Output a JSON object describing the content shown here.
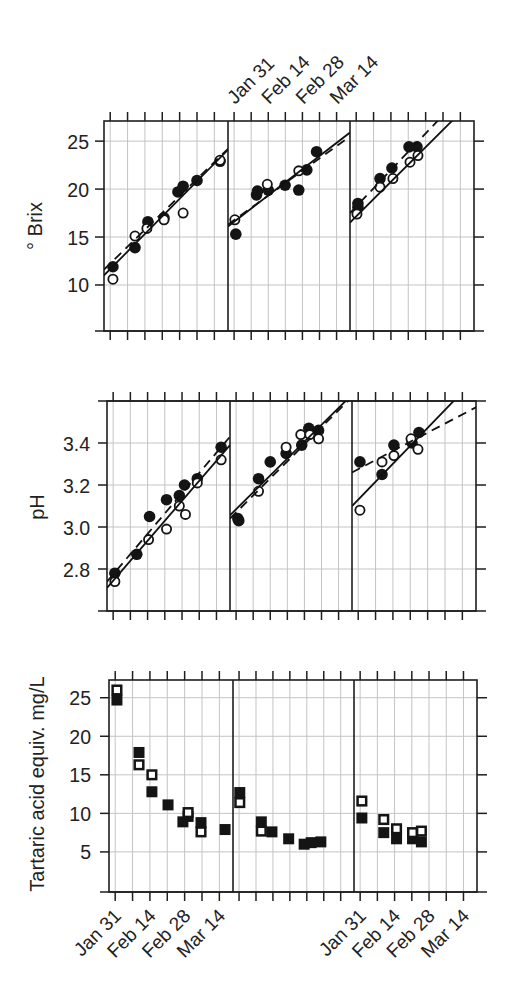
{
  "chart_data": [
    {
      "name": "brix",
      "type": "scatter",
      "title": "",
      "xlabel": "",
      "ylabel": "° Brix",
      "x_unit": "days from Jan 31",
      "xlim": [
        -2.5,
        47.5
      ],
      "xticks": [
        0,
        7,
        14,
        21,
        28,
        35,
        42
      ],
      "xtick_labels": [
        {
          "x": 0,
          "label": "Jan 31"
        },
        {
          "x": 14,
          "label": "Feb 14"
        },
        {
          "x": 28,
          "label": "Feb 28"
        },
        {
          "x": 42,
          "label": "Mar 14"
        }
      ],
      "ylim": [
        5.2,
        27.1
      ],
      "yticks": [
        10,
        15,
        20,
        25
      ],
      "ytick_labels": [
        "10",
        "15",
        "20",
        "25"
      ],
      "grid": true,
      "panels": [
        {
          "name": "panel-1",
          "series": [
            {
              "name": "filled",
              "marker": "filled-circle",
              "points": [
                [
                  1.1,
                  11.9
                ],
                [
                  10.0,
                  13.9
                ],
                [
                  15.2,
                  16.6
                ],
                [
                  21.7,
                  17.0
                ],
                [
                  27.3,
                  19.7
                ],
                [
                  29.4,
                  20.3
                ],
                [
                  35.0,
                  20.9
                ],
                [
                  44.3,
                  22.9
                ]
              ]
            },
            {
              "name": "open",
              "marker": "open-circle",
              "points": [
                [
                  1.1,
                  10.6
                ],
                [
                  10.0,
                  15.1
                ],
                [
                  14.8,
                  15.9
                ],
                [
                  21.7,
                  16.8
                ],
                [
                  29.4,
                  17.5
                ],
                [
                  44.3,
                  23.0
                ]
              ]
            }
          ],
          "fit_lines": [
            {
              "style": "solid",
              "x": [
                -2.5,
                47.5
              ],
              "y": [
                11.0,
                24.1
              ]
            },
            {
              "style": "dashed",
              "x": [
                -2.5,
                47.5
              ],
              "y": [
                11.6,
                24.2
              ]
            }
          ]
        },
        {
          "name": "panel-2",
          "series": [
            {
              "name": "filled",
              "marker": "filled-circle",
              "points": [
                [
                  0.7,
                  15.3
                ],
                [
                  9.2,
                  19.4
                ],
                [
                  9.6,
                  19.8
                ],
                [
                  14.0,
                  19.9
                ],
                [
                  20.9,
                  20.4
                ],
                [
                  26.5,
                  19.9
                ],
                [
                  29.8,
                  22.0
                ],
                [
                  33.8,
                  23.9
                ]
              ]
            },
            {
              "name": "open",
              "marker": "open-circle",
              "points": [
                [
                  0.3,
                  16.8
                ],
                [
                  13.6,
                  20.5
                ],
                [
                  26.5,
                  21.9
                ]
              ]
            }
          ],
          "fit_lines": [
            {
              "style": "solid",
              "x": [
                -2.5,
                47.5
              ],
              "y": [
                16.1,
                25.9
              ]
            },
            {
              "style": "dashed",
              "x": [
                -2.5,
                47.5
              ],
              "y": [
                16.3,
                25.5
              ]
            }
          ]
        },
        {
          "name": "panel-3",
          "series": [
            {
              "name": "filled",
              "marker": "filled-circle",
              "points": [
                [
                  0.7,
                  18.5
                ],
                [
                  0.7,
                  18.1
                ],
                [
                  9.6,
                  21.1
                ],
                [
                  14.4,
                  22.2
                ],
                [
                  21.3,
                  24.4
                ],
                [
                  24.5,
                  24.4
                ]
              ]
            },
            {
              "name": "open",
              "marker": "open-circle",
              "points": [
                [
                  0.3,
                  17.4
                ],
                [
                  9.6,
                  20.2
                ],
                [
                  14.8,
                  21.1
                ],
                [
                  21.7,
                  22.8
                ],
                [
                  24.9,
                  23.5
                ]
              ]
            }
          ],
          "fit_lines": [
            {
              "style": "solid",
              "x": [
                -2.5,
                47.5
              ],
              "y": [
                16.5,
                29.4
              ]
            },
            {
              "style": "dashed",
              "x": [
                -2.5,
                47.5
              ],
              "y": [
                17.5,
                31.1
              ]
            }
          ]
        }
      ]
    },
    {
      "name": "ph",
      "type": "scatter",
      "title": "",
      "xlabel": "",
      "ylabel": "pH",
      "x_unit": "days from Jan 31",
      "xlim": [
        -2.5,
        47.5
      ],
      "xticks": [
        0,
        7,
        14,
        21,
        28,
        35,
        42
      ],
      "ylim": [
        2.6,
        3.6
      ],
      "yticks": [
        2.8,
        3.0,
        3.2,
        3.4
      ],
      "ytick_labels": [
        "2.8",
        "3.0",
        "3.2",
        "3.4"
      ],
      "grid": true,
      "panels": [
        {
          "name": "panel-1",
          "series": [
            {
              "name": "filled",
              "marker": "filled-circle",
              "points": [
                [
                  0.7,
                  2.78
                ],
                [
                  9.6,
                  2.87
                ],
                [
                  14.8,
                  3.05
                ],
                [
                  21.7,
                  3.13
                ],
                [
                  26.9,
                  3.15
                ],
                [
                  29.0,
                  3.2
                ],
                [
                  34.2,
                  3.23
                ],
                [
                  43.9,
                  3.38
                ]
              ]
            },
            {
              "name": "open",
              "marker": "open-circle",
              "points": [
                [
                  0.7,
                  2.74
                ],
                [
                  14.4,
                  2.94
                ],
                [
                  21.7,
                  2.99
                ],
                [
                  26.9,
                  3.1
                ],
                [
                  29.4,
                  3.06
                ],
                [
                  34.2,
                  3.21
                ],
                [
                  43.9,
                  3.32
                ]
              ]
            }
          ],
          "fit_lines": [
            {
              "style": "solid",
              "x": [
                -2.5,
                47.5
              ],
              "y": [
                2.71,
                3.39
              ]
            },
            {
              "style": "dashed",
              "x": [
                -2.5,
                47.5
              ],
              "y": [
                2.74,
                3.43
              ]
            }
          ]
        },
        {
          "name": "panel-2",
          "series": [
            {
              "name": "filled",
              "marker": "filled-circle",
              "points": [
                [
                  0.7,
                  3.04
                ],
                [
                  1.1,
                  3.03
                ],
                [
                  9.2,
                  3.23
                ],
                [
                  14.0,
                  3.31
                ],
                [
                  20.5,
                  3.35
                ],
                [
                  26.9,
                  3.39
                ],
                [
                  29.8,
                  3.47
                ],
                [
                  33.8,
                  3.46
                ]
              ]
            },
            {
              "name": "open",
              "marker": "open-circle",
              "points": [
                [
                  9.2,
                  3.17
                ],
                [
                  20.5,
                  3.38
                ],
                [
                  26.5,
                  3.44
                ],
                [
                  30.2,
                  3.44
                ],
                [
                  33.8,
                  3.42
                ]
              ]
            }
          ],
          "fit_lines": [
            {
              "style": "solid",
              "x": [
                -2.5,
                47.5
              ],
              "y": [
                3.056,
                3.63
              ]
            },
            {
              "style": "dashed",
              "x": [
                -2.5,
                47.5
              ],
              "y": [
                3.04,
                3.62
              ]
            }
          ]
        },
        {
          "name": "panel-3",
          "series": [
            {
              "name": "filled",
              "marker": "filled-circle",
              "points": [
                [
                  0.7,
                  3.31
                ],
                [
                  9.6,
                  3.25
                ],
                [
                  14.4,
                  3.39
                ],
                [
                  21.7,
                  3.4
                ],
                [
                  24.5,
                  3.45
                ]
              ]
            },
            {
              "name": "open",
              "marker": "open-circle",
              "points": [
                [
                  0.7,
                  3.08
                ],
                [
                  9.6,
                  3.31
                ],
                [
                  14.4,
                  3.34
                ],
                [
                  21.3,
                  3.42
                ],
                [
                  24.1,
                  3.37
                ]
              ]
            }
          ],
          "fit_lines": [
            {
              "style": "solid",
              "x": [
                -2.5,
                47.5
              ],
              "y": [
                3.1,
                3.71
              ]
            },
            {
              "style": "dashed",
              "x": [
                -2.5,
                47.5
              ],
              "y": [
                3.26,
                3.57
              ]
            }
          ]
        }
      ]
    },
    {
      "name": "tartaric",
      "type": "scatter",
      "title": "",
      "xlabel": "",
      "ylabel": "Tartaric acid equiv. mg/L",
      "x_unit": "days from Jan 31",
      "xlim": [
        -2.5,
        47.5
      ],
      "xticks": [
        0,
        7,
        14,
        21,
        28,
        35,
        42
      ],
      "xtick_labels": [
        {
          "x": 0,
          "label": "Jan 31"
        },
        {
          "x": 14,
          "label": "Feb 14"
        },
        {
          "x": 28,
          "label": "Feb 28"
        },
        {
          "x": 42,
          "label": "Mar 14"
        }
      ],
      "ylim": [
        -0.2,
        27.3
      ],
      "yticks": [
        5,
        10,
        15,
        20,
        25
      ],
      "ytick_labels": [
        "5",
        "10",
        "15",
        "20",
        "25"
      ],
      "grid": true,
      "panels": [
        {
          "name": "panel-1",
          "series": [
            {
              "name": "filled",
              "marker": "filled-square",
              "points": [
                [
                  0.7,
                  24.7
                ],
                [
                  9.6,
                  17.9
                ],
                [
                  14.8,
                  12.8
                ],
                [
                  21.3,
                  11.1
                ],
                [
                  27.3,
                  8.9
                ],
                [
                  29.4,
                  9.6
                ],
                [
                  34.6,
                  8.8
                ],
                [
                  44.3,
                  7.9
                ]
              ]
            },
            {
              "name": "open",
              "marker": "open-square",
              "points": [
                [
                  0.7,
                  26.0
                ],
                [
                  9.6,
                  16.3
                ],
                [
                  14.8,
                  15.0
                ],
                [
                  29.4,
                  10.1
                ],
                [
                  34.6,
                  7.6
                ]
              ]
            }
          ],
          "fit_lines": []
        },
        {
          "name": "panel-2",
          "series": [
            {
              "name": "filled",
              "marker": "filled-square",
              "points": [
                [
                  0.3,
                  12.7
                ],
                [
                  9.2,
                  8.9
                ],
                [
                  13.6,
                  7.6
                ],
                [
                  20.5,
                  6.7
                ],
                [
                  26.9,
                  6.0
                ],
                [
                  29.8,
                  6.2
                ],
                [
                  33.8,
                  6.3
                ]
              ]
            },
            {
              "name": "open",
              "marker": "open-square",
              "points": [
                [
                  0.3,
                  11.4
                ],
                [
                  9.2,
                  7.7
                ]
              ]
            }
          ],
          "fit_lines": []
        },
        {
          "name": "panel-3",
          "series": [
            {
              "name": "filled",
              "marker": "filled-square",
              "points": [
                [
                  0.7,
                  9.4
                ],
                [
                  9.6,
                  7.5
                ],
                [
                  14.8,
                  6.7
                ],
                [
                  21.3,
                  6.7
                ],
                [
                  24.9,
                  6.3
                ]
              ]
            },
            {
              "name": "open",
              "marker": "open-square",
              "points": [
                [
                  0.7,
                  11.6
                ],
                [
                  9.6,
                  9.2
                ],
                [
                  14.8,
                  8.0
                ],
                [
                  21.3,
                  7.5
                ],
                [
                  24.9,
                  7.7
                ]
              ]
            }
          ],
          "fit_lines": []
        }
      ]
    }
  ]
}
